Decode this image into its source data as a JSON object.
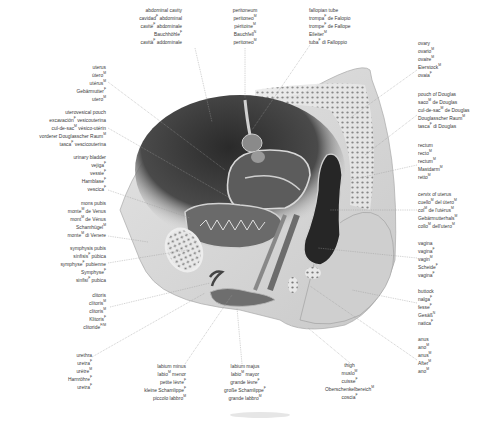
{
  "diagram": {
    "background": "#ffffff",
    "text_color": "#3a3a3a",
    "line_color": "#9a9a9a"
  },
  "labels": {
    "abdominal_cavity": {
      "lines": [
        [
          "abdominal cavity",
          ""
        ],
        [
          "cavidad",
          "F",
          " abdominal"
        ],
        [
          "cavité",
          "F",
          " abdominale"
        ],
        [
          "Bauchhöhle",
          "F",
          ""
        ],
        [
          "cavità",
          "F",
          " addominale"
        ]
      ]
    },
    "peritoneum": {
      "lines": [
        [
          "peritoneum",
          ""
        ],
        [
          "peritoneo",
          "M",
          ""
        ],
        [
          "péritoine",
          "M",
          ""
        ],
        [
          "Bauchfell",
          "N",
          ""
        ],
        [
          "peritoneo",
          "M",
          ""
        ]
      ]
    },
    "fallopian_tube": {
      "lines": [
        [
          "fallopian tube",
          ""
        ],
        [
          "trompa",
          "F",
          " de Falopio"
        ],
        [
          "trompe",
          "F",
          " de Fallope"
        ],
        [
          "Eileiter",
          "M",
          ""
        ],
        [
          "tuba",
          "F",
          " di Falloppio"
        ]
      ]
    },
    "ovary": {
      "lines": [
        [
          "ovary",
          ""
        ],
        [
          "ovario",
          "M",
          ""
        ],
        [
          "ovaire",
          "M",
          ""
        ],
        [
          "Eierstock",
          "M",
          ""
        ],
        [
          "ovaia",
          "F",
          ""
        ]
      ]
    },
    "pouch_of_douglas": {
      "lines": [
        [
          "pouch of Douglas",
          ""
        ],
        [
          "saco",
          "M",
          " de Douglas"
        ],
        [
          "cul-de-sac",
          "M",
          " de Douglas"
        ],
        [
          "Douglasscher Raum",
          "M",
          ""
        ],
        [
          "tasca",
          "F",
          " di Douglas"
        ]
      ]
    },
    "rectum": {
      "lines": [
        [
          "rectum",
          ""
        ],
        [
          "recto",
          "M",
          ""
        ],
        [
          "rectum",
          "M",
          ""
        ],
        [
          "Mastdarm",
          "M",
          ""
        ],
        [
          "retto",
          "M",
          ""
        ]
      ]
    },
    "cervix": {
      "lines": [
        [
          "cervix of uterus",
          ""
        ],
        [
          "cuello",
          "M",
          " del útero",
          "M"
        ],
        [
          "col",
          "M",
          " de l'utérus",
          "M"
        ],
        [
          "Gebärmutterhals",
          "M",
          ""
        ],
        [
          "collo",
          "M",
          " dell'utero",
          "M"
        ]
      ]
    },
    "vagina": {
      "lines": [
        [
          "vagina",
          ""
        ],
        [
          "vagina",
          "F",
          ""
        ],
        [
          "vagin",
          "M",
          ""
        ],
        [
          "Scheide",
          "F",
          ""
        ],
        [
          "vagina",
          "F",
          ""
        ]
      ]
    },
    "buttock": {
      "lines": [
        [
          "buttock",
          ""
        ],
        [
          "nalga",
          "F",
          ""
        ],
        [
          "fesse",
          "F",
          ""
        ],
        [
          "Gesäß",
          "N",
          ""
        ],
        [
          "natica",
          "F",
          ""
        ]
      ]
    },
    "anus": {
      "lines": [
        [
          "anus",
          ""
        ],
        [
          "ano",
          "M",
          ""
        ],
        [
          "anus",
          "M",
          ""
        ],
        [
          "After",
          "M",
          ""
        ],
        [
          "ano",
          "M",
          ""
        ]
      ]
    },
    "thigh": {
      "lines": [
        [
          "thigh",
          ""
        ],
        [
          "muslo",
          "M",
          ""
        ],
        [
          "cuisse",
          "F",
          ""
        ],
        [
          "Oberschenkelbereich",
          "M",
          ""
        ],
        [
          "coscia",
          "F",
          ""
        ]
      ]
    },
    "labium_majus": {
      "lines": [
        [
          "labium majus",
          ""
        ],
        [
          "labio",
          "M",
          " mayor"
        ],
        [
          "grande lèvre",
          "F",
          ""
        ],
        [
          "große Schamlippe",
          "F",
          ""
        ],
        [
          "grande labbro",
          "M",
          ""
        ]
      ]
    },
    "labium_minus": {
      "lines": [
        [
          "labium minus",
          ""
        ],
        [
          "labio",
          "M",
          " menor"
        ],
        [
          "petite lèvre",
          "F",
          ""
        ],
        [
          "kleine Schamlippe",
          "F",
          ""
        ],
        [
          "piccolo labbro",
          "M",
          ""
        ]
      ]
    },
    "urethra": {
      "lines": [
        [
          "urethra",
          ""
        ],
        [
          "uretra",
          "F",
          ""
        ],
        [
          "urètre",
          "M",
          ""
        ],
        [
          "Harnröhre",
          "F",
          ""
        ],
        [
          "uretra",
          "F",
          ""
        ]
      ]
    },
    "clitoris": {
      "lines": [
        [
          "clitoris",
          ""
        ],
        [
          "clítoris",
          "M",
          ""
        ],
        [
          "clitoris",
          "M",
          ""
        ],
        [
          "Klitoris",
          "F",
          ""
        ],
        [
          "clitoride",
          "F/M",
          ""
        ]
      ]
    },
    "symphysis_pubis": {
      "lines": [
        [
          "symphysis pubis",
          ""
        ],
        [
          "sínfisis",
          "F",
          " púbica"
        ],
        [
          "symphyse",
          "F",
          " pubienne"
        ],
        [
          "Symphyse",
          "F",
          ""
        ],
        [
          "sinfisi",
          "F",
          " pubica"
        ]
      ]
    },
    "mons_pubis": {
      "lines": [
        [
          "mons pubis",
          ""
        ],
        [
          "monte",
          "M",
          " de Venus"
        ],
        [
          "mont",
          "M",
          " de Vénus"
        ],
        [
          "Schamhügel",
          "M",
          ""
        ],
        [
          "monte",
          "M",
          " di Venere"
        ]
      ]
    },
    "urinary_bladder": {
      "lines": [
        [
          "urinary bladder",
          ""
        ],
        [
          "vejiga",
          "F",
          ""
        ],
        [
          "vessie",
          "F",
          ""
        ],
        [
          "Harnblase",
          "F",
          ""
        ],
        [
          "vescica",
          "F",
          ""
        ]
      ]
    },
    "uterovesical_pouch": {
      "lines": [
        [
          "uterovesical pouch",
          ""
        ],
        [
          "excavación",
          "F",
          " vesicouterina"
        ],
        [
          "cul-de-sac",
          "M",
          " vésico-utérin"
        ],
        [
          "vorderer Douglasscher Raum",
          "M",
          ""
        ],
        [
          "tasca",
          "F",
          " vescicouterina"
        ]
      ]
    },
    "uterus": {
      "lines": [
        [
          "uterus",
          ""
        ],
        [
          "útero",
          "M",
          ""
        ],
        [
          "utérus",
          "M",
          ""
        ],
        [
          "Gebärmutter",
          "F",
          ""
        ],
        [
          "utero",
          "M",
          ""
        ]
      ]
    }
  }
}
